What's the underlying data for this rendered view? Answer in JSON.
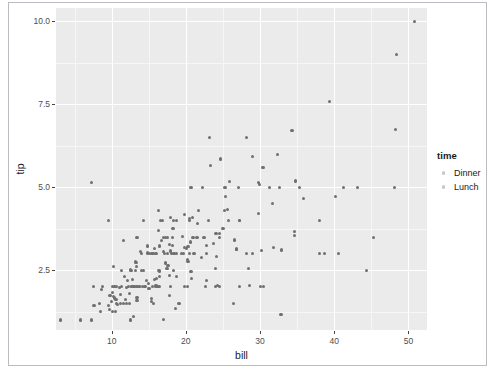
{
  "chart_data": {
    "type": "scatter",
    "title": "",
    "xlabel": "bill",
    "ylabel": "tip",
    "xlim": [
      2.5,
      52.5
    ],
    "ylim": [
      0.7,
      10.4
    ],
    "xticks": [
      10,
      20,
      30,
      40,
      50
    ],
    "xtick_labels": [
      "10",
      "20",
      "30",
      "40",
      "50"
    ],
    "yticks": [
      2.5,
      5.0,
      7.5,
      10.0
    ],
    "ytick_labels": [
      "2.5",
      "5.0",
      "7.5",
      "10.0"
    ],
    "grid": true,
    "grid_major_color": "#ffffff",
    "grid_minor_color": "#f6f6f6",
    "panel_background": "#ebebeb",
    "point_color": "#6f6f6f",
    "point_size": 3.2,
    "legend": {
      "title": "time",
      "position": "right",
      "entries": [
        {
          "label": "Dinner",
          "color": "#c9c9c9"
        },
        {
          "label": "Lunch",
          "color": "#c9c9c9"
        }
      ]
    },
    "series": [
      {
        "name": "Dinner",
        "points": [
          [
            16.99,
            1.01
          ],
          [
            10.34,
            1.66
          ],
          [
            21.01,
            3.5
          ],
          [
            23.68,
            3.31
          ],
          [
            24.59,
            3.61
          ],
          [
            25.29,
            4.71
          ],
          [
            8.77,
            2.0
          ],
          [
            26.88,
            3.12
          ],
          [
            15.04,
            1.96
          ],
          [
            14.78,
            3.23
          ],
          [
            10.27,
            1.71
          ],
          [
            35.26,
            5.0
          ],
          [
            15.42,
            1.57
          ],
          [
            18.43,
            3.0
          ],
          [
            14.83,
            3.02
          ],
          [
            21.58,
            3.92
          ],
          [
            10.33,
            1.67
          ],
          [
            16.29,
            3.71
          ],
          [
            16.97,
            3.5
          ],
          [
            20.65,
            3.35
          ],
          [
            17.92,
            4.08
          ],
          [
            20.29,
            2.75
          ],
          [
            15.77,
            2.23
          ],
          [
            39.42,
            7.58
          ],
          [
            19.82,
            3.18
          ],
          [
            17.81,
            2.34
          ],
          [
            13.37,
            2.0
          ],
          [
            12.69,
            2.0
          ],
          [
            21.7,
            4.3
          ],
          [
            19.65,
            3.0
          ],
          [
            9.55,
            1.45
          ],
          [
            18.35,
            2.5
          ],
          [
            15.06,
            3.0
          ],
          [
            20.69,
            2.45
          ],
          [
            17.78,
            3.27
          ],
          [
            24.06,
            3.6
          ],
          [
            16.31,
            2.0
          ],
          [
            16.93,
            3.07
          ],
          [
            18.69,
            2.31
          ],
          [
            31.27,
            5.0
          ],
          [
            16.04,
            2.24
          ],
          [
            17.46,
            2.54
          ],
          [
            13.94,
            3.06
          ],
          [
            9.68,
            1.32
          ],
          [
            30.4,
            5.6
          ],
          [
            18.29,
            3.0
          ],
          [
            22.23,
            5.0
          ],
          [
            32.4,
            6.0
          ],
          [
            28.55,
            2.05
          ],
          [
            18.04,
            3.0
          ],
          [
            12.54,
            2.5
          ],
          [
            10.29,
            2.6
          ],
          [
            34.81,
            5.2
          ],
          [
            9.94,
            1.56
          ],
          [
            25.56,
            4.34
          ],
          [
            19.49,
            3.51
          ],
          [
            38.01,
            3.0
          ],
          [
            26.41,
            1.5
          ],
          [
            11.24,
            1.76
          ],
          [
            48.27,
            6.73
          ],
          [
            20.29,
            3.21
          ],
          [
            13.81,
            2.0
          ],
          [
            11.02,
            1.98
          ],
          [
            18.29,
            3.76
          ],
          [
            17.59,
            2.64
          ],
          [
            20.08,
            3.15
          ],
          [
            16.45,
            2.47
          ],
          [
            3.07,
            1.0
          ],
          [
            20.23,
            2.01
          ],
          [
            15.01,
            2.09
          ],
          [
            12.02,
            1.97
          ],
          [
            17.07,
            3.0
          ],
          [
            26.86,
            3.14
          ],
          [
            25.28,
            5.0
          ],
          [
            14.73,
            2.2
          ],
          [
            10.51,
            1.25
          ],
          [
            17.92,
            3.08
          ],
          [
            27.2,
            4.0
          ],
          [
            22.76,
            3.0
          ],
          [
            17.29,
            2.71
          ],
          [
            19.44,
            3.0
          ],
          [
            16.66,
            3.4
          ],
          [
            10.07,
            1.83
          ],
          [
            32.68,
            5.0
          ],
          [
            15.98,
            2.03
          ],
          [
            34.83,
            5.17
          ],
          [
            13.03,
            2.0
          ],
          [
            18.28,
            4.0
          ],
          [
            24.71,
            5.85
          ],
          [
            21.16,
            3.0
          ],
          [
            28.97,
            3.0
          ],
          [
            22.49,
            3.5
          ],
          [
            5.75,
            1.0
          ],
          [
            16.32,
            4.3
          ],
          [
            22.75,
            3.25
          ],
          [
            40.17,
            4.73
          ],
          [
            27.28,
            4.0
          ],
          [
            12.03,
            1.5
          ],
          [
            21.01,
            3.0
          ],
          [
            12.46,
            1.5
          ],
          [
            11.35,
            2.5
          ],
          [
            15.38,
            3.0
          ],
          [
            44.3,
            2.5
          ],
          [
            22.42,
            3.48
          ],
          [
            20.92,
            4.08
          ],
          [
            15.36,
            1.64
          ],
          [
            20.49,
            4.06
          ],
          [
            25.21,
            4.29
          ],
          [
            18.24,
            3.76
          ],
          [
            14.31,
            4.0
          ],
          [
            14.0,
            3.0
          ],
          [
            7.25,
            1.0
          ],
          [
            38.07,
            4.0
          ],
          [
            23.95,
            2.55
          ],
          [
            25.71,
            4.0
          ],
          [
            17.31,
            3.5
          ],
          [
            29.93,
            5.07
          ],
          [
            10.65,
            1.5
          ],
          [
            12.43,
            1.8
          ],
          [
            24.08,
            2.92
          ],
          [
            11.69,
            2.31
          ],
          [
            13.42,
            1.68
          ],
          [
            14.26,
            2.5
          ],
          [
            15.95,
            2.0
          ],
          [
            12.48,
            2.52
          ],
          [
            29.8,
            4.2
          ],
          [
            14.52,
            2.0
          ],
          [
            11.38,
            2.0
          ],
          [
            22.82,
            2.18
          ],
          [
            19.08,
            1.5
          ],
          [
            20.27,
            2.83
          ],
          [
            11.17,
            1.5
          ],
          [
            12.26,
            2.0
          ],
          [
            18.26,
            3.25
          ],
          [
            8.51,
            1.25
          ],
          [
            10.33,
            2.0
          ],
          [
            14.15,
            2.0
          ],
          [
            16.0,
            2.0
          ],
          [
            13.16,
            2.75
          ],
          [
            17.47,
            3.5
          ],
          [
            34.3,
            6.7
          ],
          [
            41.19,
            5.0
          ],
          [
            27.05,
            5.0
          ],
          [
            16.43,
            2.3
          ],
          [
            8.35,
            1.5
          ],
          [
            18.64,
            1.36
          ],
          [
            11.87,
            1.63
          ],
          [
            9.78,
            1.73
          ],
          [
            7.51,
            2.0
          ],
          [
            14.07,
            2.5
          ],
          [
            13.13,
            2.0
          ],
          [
            17.26,
            2.74
          ],
          [
            24.55,
            2.0
          ],
          [
            19.77,
            2.0
          ],
          [
            29.85,
            5.14
          ],
          [
            48.17,
            5.0
          ],
          [
            25.0,
            3.75
          ],
          [
            13.39,
            2.61
          ],
          [
            16.49,
            2.0
          ],
          [
            21.5,
            3.5
          ],
          [
            12.66,
            2.5
          ],
          [
            16.21,
            2.0
          ],
          [
            13.81,
            2.0
          ],
          [
            17.51,
            3.0
          ],
          [
            24.52,
            3.48
          ],
          [
            20.76,
            2.24
          ],
          [
            31.71,
            4.5
          ],
          [
            10.59,
            1.61
          ],
          [
            10.63,
            2.0
          ],
          [
            50.81,
            10.0
          ],
          [
            15.81,
            3.16
          ],
          [
            7.25,
            5.15
          ],
          [
            31.85,
            3.18
          ],
          [
            16.82,
            4.0
          ],
          [
            32.9,
            3.11
          ],
          [
            17.89,
            2.0
          ],
          [
            14.48,
            2.0
          ],
          [
            9.6,
            4.0
          ],
          [
            34.63,
            3.55
          ],
          [
            34.65,
            3.68
          ],
          [
            23.33,
            5.65
          ],
          [
            45.35,
            3.5
          ],
          [
            23.17,
            6.5
          ],
          [
            40.55,
            3.0
          ],
          [
            20.69,
            5.0
          ],
          [
            20.9,
            3.5
          ],
          [
            30.46,
            2.0
          ],
          [
            18.15,
            3.5
          ],
          [
            23.1,
            4.0
          ],
          [
            15.69,
            1.5
          ],
          [
            19.81,
            4.19
          ],
          [
            28.44,
            2.56
          ],
          [
            15.48,
            2.02
          ],
          [
            16.58,
            4.0
          ],
          [
            7.56,
            1.44
          ],
          [
            10.34,
            2.0
          ],
          [
            43.11,
            5.0
          ],
          [
            13.0,
            2.0
          ],
          [
            13.51,
            2.0
          ],
          [
            18.71,
            4.0
          ],
          [
            12.74,
            2.01
          ],
          [
            13.0,
            2.0
          ],
          [
            16.4,
            2.5
          ],
          [
            20.53,
            4.0
          ],
          [
            16.47,
            3.23
          ],
          [
            26.59,
            3.41
          ],
          [
            38.73,
            3.0
          ],
          [
            24.27,
            2.03
          ],
          [
            12.76,
            2.23
          ],
          [
            30.06,
            2.0
          ],
          [
            25.89,
            5.16
          ],
          [
            48.33,
            9.0
          ],
          [
            13.27,
            2.5
          ],
          [
            28.17,
            6.5
          ],
          [
            12.9,
            1.1
          ],
          [
            28.15,
            3.0
          ],
          [
            11.59,
            1.5
          ],
          [
            7.74,
            1.44
          ],
          [
            30.14,
            3.09
          ],
          [
            12.16,
            2.2
          ],
          [
            13.42,
            3.48
          ],
          [
            8.58,
            1.92
          ],
          [
            15.98,
            3.0
          ],
          [
            13.42,
            1.58
          ],
          [
            16.27,
            2.5
          ],
          [
            10.09,
            2.0
          ],
          [
            20.45,
            3.0
          ],
          [
            13.28,
            2.72
          ],
          [
            22.12,
            2.88
          ],
          [
            24.01,
            2.0
          ],
          [
            15.69,
            3.0
          ],
          [
            11.61,
            3.39
          ],
          [
            10.77,
            1.47
          ],
          [
            15.53,
            3.0
          ],
          [
            10.07,
            1.25
          ],
          [
            12.6,
            1.0
          ],
          [
            32.83,
            1.17
          ],
          [
            35.83,
            4.67
          ],
          [
            29.03,
            5.92
          ],
          [
            27.18,
            2.0
          ],
          [
            22.67,
            2.0
          ],
          [
            17.82,
            1.75
          ],
          [
            18.78,
            3.0
          ]
        ]
      }
    ]
  },
  "axes": {
    "xlabel": "bill",
    "ylabel": "tip",
    "xtick_labels": [
      "10",
      "20",
      "30",
      "40",
      "50"
    ],
    "ytick_labels": [
      "2.5",
      "5.0",
      "7.5",
      "10.0"
    ]
  },
  "legend": {
    "title": "time",
    "items": [
      {
        "label": "Dinner"
      },
      {
        "label": "Lunch"
      }
    ]
  }
}
